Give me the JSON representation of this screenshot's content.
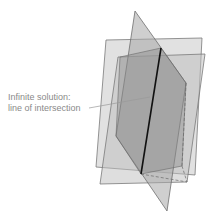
{
  "diagram": {
    "label_line1": "Infinite solution:",
    "label_line2": "line of intersection",
    "colors": {
      "background": "#ffffff",
      "plane_fill": "#9a9a9a",
      "plane_stroke": "#6f6f6f",
      "intersection_line": "#111111",
      "label_text": "#8a8a8a"
    }
  }
}
